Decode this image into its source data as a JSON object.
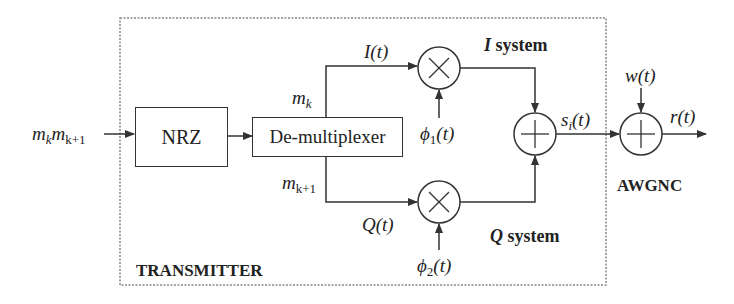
{
  "diagram": {
    "input_label": {
      "m": "m",
      "k": "k",
      "m2": "m",
      "k1": "k+1"
    },
    "transmitter_label": "TRANSMITTER",
    "channel_label": "AWGNC",
    "blocks": {
      "nrz": "NRZ",
      "demux": "De-multiplexer"
    },
    "branch_labels": {
      "upper_m": "m",
      "upper_sub": "k",
      "lower_m": "m",
      "lower_sub": "k+1",
      "i_signal": "I(t)",
      "q_signal": "Q(t)"
    },
    "systems": {
      "i_system": {
        "symbol": "I",
        "text": " system"
      },
      "q_system": {
        "symbol": "Q",
        "text": " system"
      }
    },
    "carriers": {
      "phi1": {
        "sym": "ϕ",
        "sub": "1",
        "arg": "(t)"
      },
      "phi2": {
        "sym": "ϕ",
        "sub": "2",
        "arg": "(t)"
      }
    },
    "signals": {
      "si": {
        "s": "s",
        "sub": "i",
        "arg": "(t)"
      },
      "noise": "w(t)",
      "received": "r(t)"
    },
    "operators": {
      "multiplier": "×",
      "adder": "+"
    },
    "colors": {
      "line": "#333333",
      "dashed_border": "#888888"
    }
  }
}
